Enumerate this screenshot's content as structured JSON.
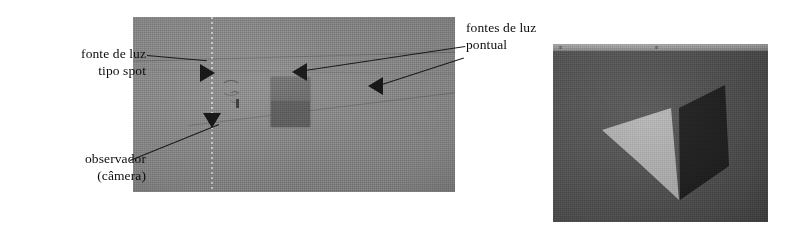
{
  "figure": {
    "background_color": "#ffffff"
  },
  "annotations": [
    {
      "id": "spot-light",
      "name": "fonte-de-luz-tipo-spot",
      "line1": "fonte de luz",
      "line2": "tipo spot",
      "align": "right"
    },
    {
      "id": "observer",
      "name": "observador-camera",
      "line1": "observador",
      "line2": "(câmera)",
      "align": "right"
    },
    {
      "id": "point-lights",
      "name": "fontes-de-luz-pontual",
      "line1": "fontes de luz",
      "line2": "pontual",
      "align": "left"
    }
  ],
  "left_viewport": {
    "name": "scene-top-view",
    "background_color": "#8e8e8e",
    "markers": [
      {
        "id": "spot-marker",
        "shape": "triangle-right",
        "x": 67,
        "y": 47,
        "color": "#121212"
      },
      {
        "id": "camera-marker",
        "shape": "triangle-down",
        "x": 70,
        "y": 96,
        "color": "#121212"
      },
      {
        "id": "point-light-1",
        "shape": "triangle-left",
        "x": 159,
        "y": 46,
        "color": "#121212"
      },
      {
        "id": "point-light-2",
        "shape": "triangle-left",
        "x": 235,
        "y": 60,
        "color": "#121212"
      }
    ],
    "block": {
      "id": "scene-object",
      "color_top": "#6f6f6f",
      "color_bottom": "#5a5a5a"
    }
  },
  "right_viewport": {
    "name": "rendered-result",
    "background_color": "#565656",
    "titlebar_color": "#a2a2a2",
    "faces": [
      {
        "id": "lit-face",
        "label": "face iluminada",
        "fill": "#b2b2b2",
        "points": "49,86 118,64 126,156 85,118"
      },
      {
        "id": "shadow-face",
        "label": "face em sombra",
        "fill": "#1e1e1e",
        "points": "126,64 172,41 176,122 127,156"
      }
    ]
  },
  "colors": {
    "ink": "#0d0d0d",
    "leader": "#1a1a1a",
    "scene_gray": "#8e8e8e",
    "render_gray": "#565656",
    "lit_face": "#b2b2b2",
    "shadow_face": "#1e1e1e"
  }
}
